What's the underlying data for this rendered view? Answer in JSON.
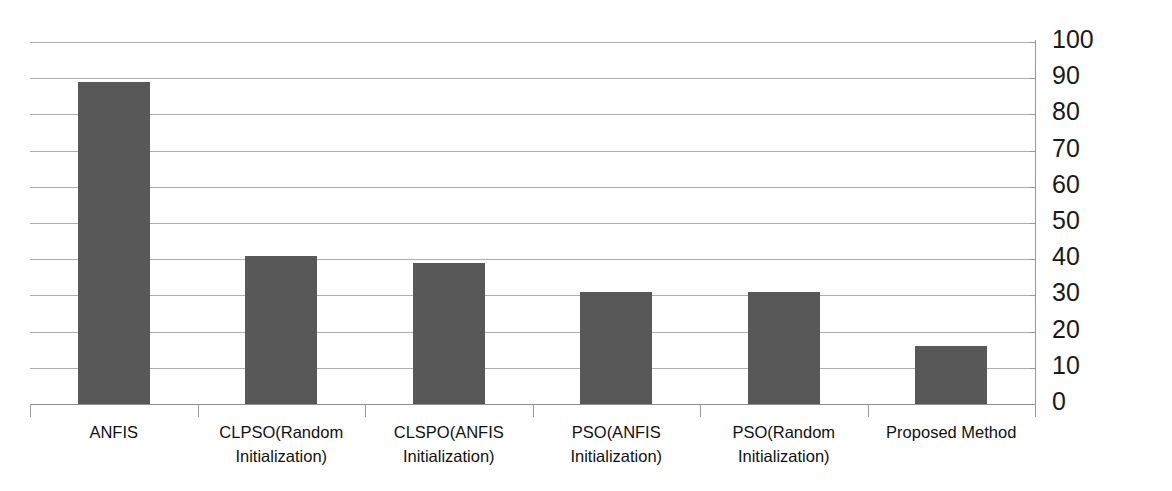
{
  "chart_data": {
    "type": "bar",
    "title": "",
    "subtitle": "",
    "xlabel": "",
    "ylabel": "",
    "ylim": [
      0,
      100
    ],
    "ytick_step": 10,
    "yticks": [
      "100",
      "90",
      "80",
      "70",
      "60",
      "50",
      "40",
      "30",
      "20",
      "10",
      "0"
    ],
    "grid": true,
    "legend": false,
    "legend_position": "none",
    "axis_position": "right",
    "bar_color": "#585858",
    "gridline_color": "#aeaeae",
    "categories": [
      "ANFIS",
      "CLPSO(Random Initialization)",
      "CLSPO(ANFIS Initialization)",
      "PSO(ANFIS Initialization)",
      "PSO(Random Initialization)",
      "Proposed Method"
    ],
    "category_lines": [
      [
        "ANFIS"
      ],
      [
        "CLPSO(Random",
        "Initialization)"
      ],
      [
        "CLSPO(ANFIS",
        "Initialization)"
      ],
      [
        "PSO(ANFIS",
        "Initialization)"
      ],
      [
        "PSO(Random",
        "Initialization)"
      ],
      [
        "Proposed Method"
      ]
    ],
    "values": [
      89,
      41,
      39,
      31,
      31,
      16
    ]
  }
}
